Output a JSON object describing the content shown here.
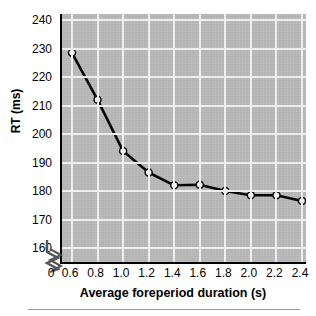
{
  "chart_data": {
    "type": "line",
    "title": "",
    "xlabel": "Average foreperiod duration (s)",
    "ylabel": "RT (ms)",
    "x": [
      0.6,
      0.8,
      1.0,
      1.2,
      1.4,
      1.6,
      1.8,
      2.0,
      2.2,
      2.4
    ],
    "values": [
      228.5,
      212.0,
      194.0,
      186.5,
      182.0,
      182.2,
      180.0,
      178.5,
      178.5,
      176.5
    ],
    "series": [
      {
        "name": "RT",
        "values": [
          228.5,
          212.0,
          194.0,
          186.5,
          182.0,
          182.2,
          180.0,
          178.5,
          178.5,
          176.5
        ]
      }
    ],
    "xlim": [
      0.5,
      2.5
    ],
    "ylim": [
      155,
      240
    ],
    "xticks": [
      "0",
      "0.6",
      "0.8",
      "1.0",
      "1.2",
      "1.4",
      "1.6",
      "1.8",
      "2.0",
      "2.2",
      "2.4"
    ],
    "xtick_values": [
      0,
      0.6,
      0.8,
      1.0,
      1.2,
      1.4,
      1.6,
      1.8,
      2.0,
      2.2,
      2.4
    ],
    "yticks": [
      "160",
      "170",
      "180",
      "190",
      "200",
      "210",
      "220",
      "230",
      "240"
    ],
    "ytick_values": [
      160,
      170,
      180,
      190,
      200,
      210,
      220,
      230,
      240
    ],
    "grid": true,
    "grid_color": "#f2f2f2",
    "legend": "none",
    "axis_break": "x-axis-break-between-0-and-0.6",
    "marker": "open-circle",
    "marker_face_color": "#ffffff",
    "marker_edge_color": "#000000",
    "line_color": "#000000",
    "plot_background": "#b9b9b9",
    "figure_background": "#ffffff"
  },
  "axes": {
    "y_title": "RT (ms)",
    "x_title": "Average foreperiod duration (s)"
  },
  "icons": {
    "axis_break": "axis-break-zigzag-icon"
  }
}
